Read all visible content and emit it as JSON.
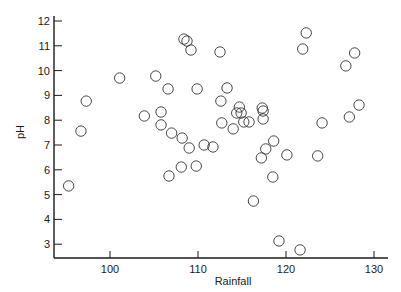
{
  "chart_data": {
    "type": "scatter",
    "title": "",
    "xlabel": "Rainfall",
    "ylabel": "pH",
    "xlim": [
      93.5,
      131.5
    ],
    "ylim": [
      2.4,
      12.2
    ],
    "xticks": [
      100,
      110,
      120,
      130
    ],
    "yticks": [
      3,
      4,
      5,
      6,
      7,
      8,
      9,
      10,
      11,
      12
    ],
    "grid": false,
    "legend": "none",
    "marker": "open-circle",
    "series": [
      {
        "name": "samples",
        "points": [
          [
            95.3,
            5.35
          ],
          [
            96.7,
            7.56
          ],
          [
            97.3,
            8.77
          ],
          [
            101.1,
            9.7
          ],
          [
            105.2,
            9.78
          ],
          [
            106.6,
            9.26
          ],
          [
            103.9,
            8.17
          ],
          [
            105.8,
            8.33
          ],
          [
            105.8,
            7.81
          ],
          [
            107.0,
            7.48
          ],
          [
            108.2,
            7.28
          ],
          [
            109.0,
            6.88
          ],
          [
            106.7,
            5.75
          ],
          [
            108.1,
            6.11
          ],
          [
            109.8,
            6.15
          ],
          [
            108.4,
            11.27
          ],
          [
            108.75,
            11.19
          ],
          [
            109.2,
            10.83
          ],
          [
            112.5,
            10.75
          ],
          [
            109.9,
            9.26
          ],
          [
            113.3,
            9.3
          ],
          [
            112.6,
            8.77
          ],
          [
            114.7,
            8.53
          ],
          [
            114.4,
            8.29
          ],
          [
            114.9,
            8.29
          ],
          [
            115.2,
            7.93
          ],
          [
            115.8,
            7.93
          ],
          [
            112.7,
            7.89
          ],
          [
            114.0,
            7.65
          ],
          [
            117.3,
            8.49
          ],
          [
            117.4,
            8.37
          ],
          [
            117.4,
            8.05
          ],
          [
            110.7,
            7.0
          ],
          [
            111.7,
            6.92
          ],
          [
            118.6,
            7.16
          ],
          [
            117.7,
            6.84
          ],
          [
            117.2,
            6.48
          ],
          [
            120.1,
            6.6
          ],
          [
            123.6,
            6.56
          ],
          [
            118.5,
            5.71
          ],
          [
            116.3,
            4.74
          ],
          [
            119.2,
            3.13
          ],
          [
            121.6,
            2.77
          ],
          [
            122.3,
            11.52
          ],
          [
            121.9,
            10.87
          ],
          [
            127.8,
            10.71
          ],
          [
            126.8,
            10.19
          ],
          [
            128.3,
            8.61
          ],
          [
            127.2,
            8.13
          ],
          [
            124.1,
            7.89
          ]
        ]
      }
    ]
  }
}
